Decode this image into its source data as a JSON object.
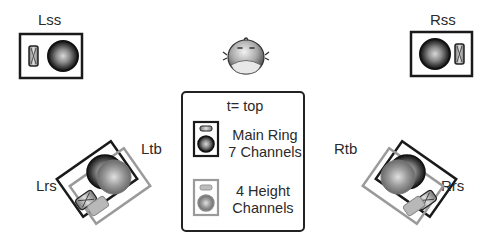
{
  "diagram": {
    "type": "speaker-layout",
    "listener": {
      "icon": "listener-head-icon"
    },
    "speakers": [
      {
        "id": "Lss",
        "label": "Lss",
        "layer": "main",
        "position": "left-side-surround"
      },
      {
        "id": "Rss",
        "label": "Rss",
        "layer": "main",
        "position": "right-side-surround"
      },
      {
        "id": "Lrs",
        "label": "Lrs",
        "layer": "main",
        "position": "left-rear-surround"
      },
      {
        "id": "Ltb",
        "label": "Ltb",
        "layer": "height",
        "position": "left-top-back"
      },
      {
        "id": "Rtb",
        "label": "Rtb",
        "layer": "height",
        "position": "right-top-back"
      },
      {
        "id": "Rrs",
        "label": "Rrs",
        "layer": "main",
        "position": "right-rear-surround"
      }
    ],
    "legend": {
      "title": "t= top",
      "items": [
        {
          "line1": "Main Ring",
          "line2": "7 Channels",
          "color": "#1a1a1a"
        },
        {
          "line1": "4 Height",
          "line2": "Channels",
          "color": "#9a9a9a"
        }
      ]
    },
    "colors": {
      "main": "#1a1a1a",
      "height": "#9a9a9a",
      "background": "#ffffff"
    }
  }
}
